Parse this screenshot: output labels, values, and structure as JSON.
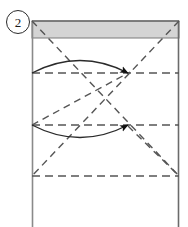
{
  "figure": {
    "step_label": "2",
    "step_label_style": "circled-number",
    "caption": "",
    "colors": {
      "outline": "#6b6b6b",
      "shaded_band_fill": "#d4d4d4",
      "shaded_band_stroke": "#7a7a7a",
      "dashed_line": "#555555",
      "curve_stroke": "#2b2b2b",
      "arrowhead_fill": "#111111",
      "badge_text": "#1a1a1a",
      "background": "#ffffff"
    },
    "canvas": {
      "width": 188,
      "height": 227
    },
    "sheet": {
      "name": "paper-sheet",
      "left": 32,
      "right": 179,
      "top": 21,
      "bottom": 227,
      "note": "open at bottom edge"
    },
    "shaded_band": {
      "name": "top-folded-flap",
      "left": 32,
      "right": 179,
      "top": 21,
      "bottom": 38
    },
    "crease_lines_horizontal": [
      {
        "id": "crease-1",
        "y": 73,
        "x1": 32,
        "x2": 179,
        "style": "dashed"
      },
      {
        "id": "crease-2",
        "y": 125,
        "x1": 32,
        "x2": 179,
        "style": "dashed"
      },
      {
        "id": "crease-3",
        "y": 176,
        "x1": 32,
        "x2": 179,
        "style": "dashed"
      }
    ],
    "crease_lines_diagonal": [
      {
        "id": "diagonal-tl-br",
        "x1": 32,
        "y1": 21,
        "x2": 179,
        "y2": 176,
        "style": "dashed"
      },
      {
        "id": "diagonal-tr-bl",
        "x1": 179,
        "y1": 21,
        "x2": 32,
        "y2": 176,
        "style": "dashed"
      },
      {
        "id": "diagonal-left-to-node-1",
        "x1": 32,
        "y1": 125,
        "x2": 128,
        "y2": 73,
        "style": "dashed"
      },
      {
        "id": "diagonal-node-2-to-right",
        "x1": 128,
        "y1": 125,
        "x2": 179,
        "y2": 176,
        "style": "dashed"
      }
    ],
    "fold_arrows": [
      {
        "id": "fold-arrow-upper",
        "direction": "left-to-right",
        "bulge": "upward",
        "start": {
          "x": 32,
          "y": 73
        },
        "end": {
          "x": 128,
          "y": 73
        },
        "apex": {
          "x": 80,
          "y": 54
        }
      },
      {
        "id": "fold-arrow-lower",
        "direction": "left-to-right",
        "bulge": "downward",
        "start": {
          "x": 32,
          "y": 125
        },
        "end": {
          "x": 128,
          "y": 125
        },
        "apex": {
          "x": 80,
          "y": 144
        }
      }
    ],
    "intersection_nodes": [
      {
        "id": "node-center",
        "x": 105,
        "y": 99
      },
      {
        "id": "node-upper-arrow-tip",
        "x": 128,
        "y": 73
      },
      {
        "id": "node-lower-arrow-tip",
        "x": 128,
        "y": 125
      }
    ]
  }
}
